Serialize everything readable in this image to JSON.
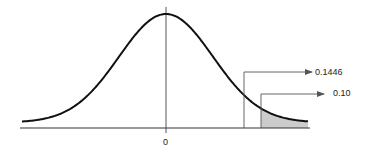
{
  "chart_data": {
    "type": "area",
    "title": "",
    "xlabel": "",
    "ylabel": "",
    "x_tick_labels": [
      "0"
    ],
    "curve": "normal density, mean 0",
    "annotations": [
      {
        "label": "0.1446",
        "points_to": "area to the right of first vertical line (unshaded region boundary)"
      },
      {
        "label": "0.10",
        "points_to": "shaded right-tail area"
      }
    ],
    "shaded_region": {
      "side": "right tail",
      "area": 0.1
    },
    "grid": false,
    "legend": false
  },
  "labels": {
    "center_tick": "0",
    "annotation_upper": "0.1446",
    "annotation_lower": "0.10"
  },
  "colors": {
    "curve": "#111111",
    "axis": "#333333",
    "shade": "#cccccc",
    "leader": "#555555"
  }
}
